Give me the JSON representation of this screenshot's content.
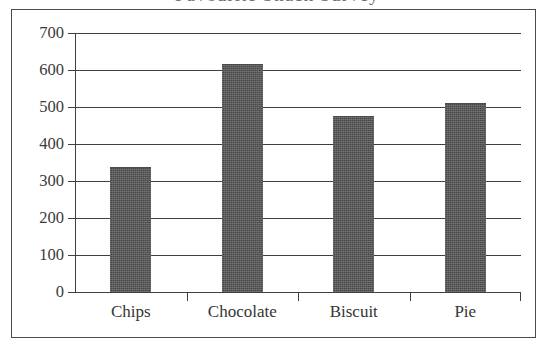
{
  "figure": {
    "clipped_title_fragment": "Favourite Snack Survey"
  },
  "chart_data": {
    "type": "bar",
    "title": "",
    "xlabel": "",
    "ylabel": "",
    "categories": [
      "Chips",
      "Chocolate",
      "Biscuit",
      "Pie"
    ],
    "values": [
      335,
      613,
      473,
      508
    ],
    "ylim": [
      0,
      700
    ],
    "yticks": [
      0,
      100,
      200,
      300,
      400,
      500,
      600,
      700
    ],
    "ytick_labels": [
      "0",
      "100",
      "200",
      "300",
      "400",
      "500",
      "600",
      "700"
    ],
    "grid": true,
    "legend": false,
    "bar_color": "#575757",
    "axis_color": "#3f3f3f",
    "frame_color": "#4a4a4a"
  }
}
